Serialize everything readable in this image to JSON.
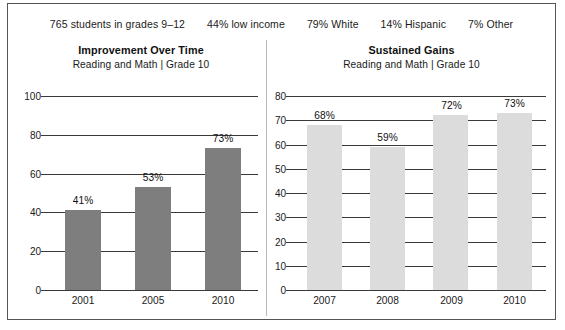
{
  "header": {
    "stats": [
      {
        "value": "765",
        "label": "students in grades 9–12"
      },
      {
        "value": "44%",
        "label": "low income"
      },
      {
        "value": "79%",
        "label": "White"
      },
      {
        "value": "14%",
        "label": "Hispanic"
      },
      {
        "value": "7%",
        "label": "Other"
      }
    ]
  },
  "colors": {
    "bar_left": "#7e7e7e",
    "bar_right": "#dcdcdc",
    "axis": "#3a3a3a",
    "border": "#555555",
    "divider": "#b8b8b8"
  },
  "panels": {
    "left": {
      "title": "Improvement Over Time",
      "subtitle": "Reading and Math  |  Grade 10"
    },
    "right": {
      "title": "Sustained Gains",
      "subtitle": "Reading and Math  |  Grade 10"
    }
  },
  "chart_data": [
    {
      "type": "bar",
      "title": "Improvement Over Time",
      "subtitle": "Reading and Math  |  Grade 10",
      "categories": [
        "2001",
        "2005",
        "2010"
      ],
      "values": [
        41,
        53,
        73
      ],
      "data_labels": [
        "41%",
        "53%",
        "73%"
      ],
      "xlabel": "",
      "ylabel": "",
      "ylim": [
        0,
        100
      ],
      "yticks": [
        0,
        20,
        40,
        60,
        80,
        100
      ],
      "ytick_labels": [
        "0",
        "20",
        "40",
        "60",
        "80",
        "100"
      ],
      "grid": true,
      "legend": false,
      "bar_color": "#7e7e7e"
    },
    {
      "type": "bar",
      "title": "Sustained Gains",
      "subtitle": "Reading and Math  |  Grade 10",
      "categories": [
        "2007",
        "2008",
        "2009",
        "2010"
      ],
      "values": [
        68,
        59,
        72,
        73
      ],
      "data_labels": [
        "68%",
        "59%",
        "72%",
        "73%"
      ],
      "xlabel": "",
      "ylabel": "",
      "ylim": [
        0,
        80
      ],
      "yticks": [
        0,
        10,
        20,
        30,
        40,
        50,
        60,
        70,
        80
      ],
      "ytick_labels": [
        "0",
        "10",
        "20",
        "30",
        "40",
        "50",
        "60",
        "70",
        "80"
      ],
      "grid": true,
      "legend": false,
      "bar_color": "#dcdcdc"
    }
  ]
}
